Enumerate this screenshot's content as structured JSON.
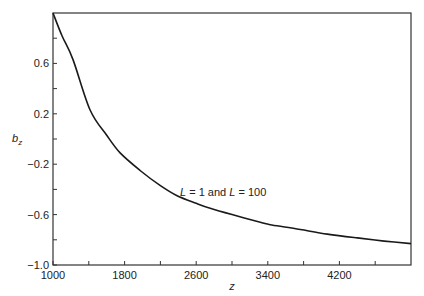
{
  "chart_data": {
    "type": "line",
    "title": "",
    "xlabel": "z",
    "ylabel": "b_z",
    "xlim": [
      1000,
      5000
    ],
    "ylim": [
      -1.0,
      1.0
    ],
    "x_ticks": [
      1000,
      1800,
      2600,
      3400,
      4200
    ],
    "x_minor_ticks": [
      1400,
      2200,
      3000,
      3800,
      4600
    ],
    "y_ticks": [
      -1.0,
      -0.6,
      -0.2,
      0.2,
      0.6
    ],
    "y_tick_labels": [
      "−1.0",
      "−0.6",
      "−0.2",
      "0.2",
      "0.6"
    ],
    "y_minor_ticks": [
      -0.8,
      -0.4,
      0.0,
      0.4,
      0.8
    ],
    "grid": false,
    "legend": null,
    "annotations": [
      {
        "text_parts": [
          "L",
          " = 1 and ",
          "L",
          " = 100"
        ],
        "x": 2750,
        "y": -0.48
      }
    ],
    "series": [
      {
        "name": "L = 1 and L = 100",
        "x": [
          1000,
          1100,
          1224,
          1414,
          1600,
          1750,
          1973,
          2200,
          2387,
          2600,
          2756,
          3000,
          3316,
          3427,
          3700,
          4065,
          4400,
          4700,
          5000
        ],
        "y": [
          1.0,
          0.82,
          0.63,
          0.23,
          0.03,
          -0.11,
          -0.25,
          -0.37,
          -0.45,
          -0.51,
          -0.55,
          -0.6,
          -0.66,
          -0.68,
          -0.71,
          -0.755,
          -0.785,
          -0.81,
          -0.83
        ]
      }
    ]
  },
  "labels": {
    "x_axis": "z",
    "y_axis_main": "b",
    "y_axis_sub": "z",
    "annotation_L1": "L",
    "annotation_mid": " = 1 and ",
    "annotation_L2": "L",
    "annotation_end": " = 100"
  }
}
